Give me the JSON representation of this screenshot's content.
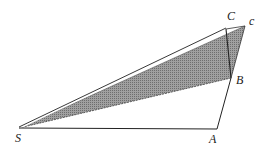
{
  "diagram": {
    "points": {
      "S": {
        "label": "S",
        "x": 19,
        "y": 128
      },
      "A": {
        "label": "A",
        "x": 217,
        "y": 129
      },
      "B": {
        "label": "B",
        "x": 231,
        "y": 78
      },
      "C": {
        "label": "C",
        "x": 226,
        "y": 29
      },
      "c": {
        "label": "c",
        "x": 245,
        "y": 26
      }
    },
    "shaded_region": [
      "S",
      "c",
      "B"
    ],
    "segments": [
      [
        "S",
        "A"
      ],
      [
        "A",
        "B"
      ],
      [
        "B",
        "C"
      ],
      [
        "S",
        "C"
      ],
      [
        "B",
        "c"
      ],
      [
        "C",
        "c"
      ]
    ],
    "colors": {
      "shade": "#8c8c8c",
      "line": "#222222"
    }
  }
}
